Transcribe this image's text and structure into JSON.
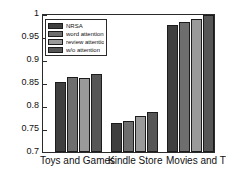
{
  "chart_data": {
    "type": "bar",
    "title": "",
    "xlabel": "",
    "ylabel": "RMSE",
    "ylim": [
      0.7,
      1.0
    ],
    "yticks": [
      "0.7",
      "0.75",
      "0.8",
      "0.85",
      "0.9",
      "0.95",
      "1"
    ],
    "ytick_values": [
      0.7,
      0.75,
      0.8,
      0.85,
      0.9,
      0.95,
      1.0
    ],
    "grid": false,
    "legend_position": "upper-left-inside",
    "categories": [
      "Toys and Games",
      "Kindle Store",
      "Movies and TV"
    ],
    "series": [
      {
        "name": "NRSA",
        "color": "#3f3f3f",
        "values": [
          0.853,
          0.763,
          0.978
        ]
      },
      {
        "name": "word attention",
        "color": "#6e6e6e",
        "values": [
          0.864,
          0.767,
          0.985
        ]
      },
      {
        "name": "review attention",
        "color": "#9a9a9a",
        "values": [
          0.862,
          0.778,
          0.991
        ]
      },
      {
        "name": "w/o attention",
        "color": "#565656",
        "values": [
          0.87,
          0.788,
          1.0
        ]
      }
    ]
  },
  "axis": {
    "ylabel": "RMSE",
    "ytick_labels": [
      "1",
      "0.95",
      "0.9",
      "0.85",
      "0.8",
      "0.75",
      "0.7"
    ],
    "xtick_labels": [
      "Toys and Games",
      "Kindle Store",
      "Movies and TV"
    ]
  },
  "legend": {
    "items": [
      {
        "label": "NRSA"
      },
      {
        "label": "word attention"
      },
      {
        "label": "review attention"
      },
      {
        "label": "w/o attention"
      }
    ]
  }
}
